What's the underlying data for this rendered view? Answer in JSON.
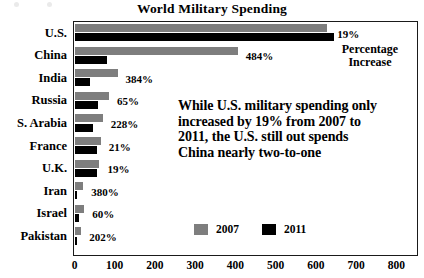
{
  "chart_data": {
    "type": "bar",
    "orientation": "horizontal",
    "title": "World Military Spending",
    "xlabel": "",
    "ylabel": "",
    "xlim": [
      0,
      850
    ],
    "grid": false,
    "legend_position": "bottom-center",
    "categories": [
      "U.S.",
      "China",
      "India",
      "Russia",
      "S. Arabia",
      "France",
      "U.K.",
      "Iran",
      "Israel",
      "Pakistan"
    ],
    "xticks": [
      0,
      100,
      200,
      300,
      400,
      500,
      600,
      700,
      800
    ],
    "series": [
      {
        "name": "2007",
        "color": "#7e7e7e",
        "values": [
          628,
          406,
          107,
          86,
          70,
          65,
          62,
          22,
          24,
          17
        ]
      },
      {
        "name": "2011",
        "color": "#000000",
        "values": [
          645,
          81,
          38,
          58,
          47,
          57,
          56,
          6,
          11,
          5
        ]
      }
    ],
    "data_labels": {
      "title": "Percentage Increase",
      "values": [
        "19%",
        "484%",
        "384%",
        "65%",
        "228%",
        "21%",
        "19%",
        "380%",
        "60%",
        "202%"
      ]
    },
    "annotation": "While U.S. military spending only increased by 19% from 2007 to 2011, the U.S. still out spends China nearly two-to-one"
  },
  "legend": [
    {
      "label": "2007",
      "color": "#7e7e7e"
    },
    {
      "label": "2011",
      "color": "#000000"
    }
  ],
  "callouts": {
    "percentage_increase_line1": "Percentage",
    "percentage_increase_line2": "Increase"
  }
}
